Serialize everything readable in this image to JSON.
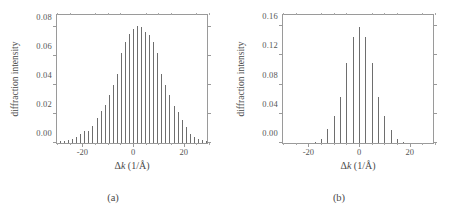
{
  "figure": {
    "panels": [
      {
        "id": "a",
        "caption": "(a)",
        "xlabel_delta": "Δ",
        "xlabel_k": "k",
        "xlabel_unit": " (1/Å)",
        "ylabel": "diffraction intensity"
      },
      {
        "id": "b",
        "caption": "(b)",
        "xlabel_delta": "Δ",
        "xlabel_k": "k",
        "xlabel_unit": " (1/Å)",
        "ylabel": "diffraction intensity"
      }
    ]
  },
  "chart_data": [
    {
      "type": "bar",
      "panel": "a",
      "title": "",
      "xlabel": "Δk (1/Å)",
      "ylabel": "diffraction intensity",
      "xlim": [
        -30,
        30
      ],
      "ylim": [
        0.0,
        0.09
      ],
      "xticks": [
        -20,
        0,
        20
      ],
      "xtick_labels": [
        "-20",
        "0",
        "20"
      ],
      "yticks": [
        0.0,
        0.02,
        0.04,
        0.06,
        0.08
      ],
      "ytick_labels": [
        "0.00",
        "0.02",
        "0.04",
        "0.06",
        "0.08"
      ],
      "grid": false,
      "legend": false,
      "peak_spacing": 1.6,
      "x": [
        -28.8,
        -27.2,
        -25.6,
        -24.0,
        -22.4,
        -20.8,
        -19.2,
        -17.6,
        -16.0,
        -14.4,
        -12.8,
        -11.2,
        -9.6,
        -8.0,
        -6.4,
        -4.8,
        -3.2,
        -1.6,
        0.0,
        1.6,
        3.2,
        4.8,
        6.4,
        8.0,
        9.6,
        11.2,
        12.8,
        14.4,
        16.0,
        17.6,
        19.2,
        20.8,
        22.4,
        24.0,
        25.6,
        27.2,
        28.8
      ],
      "values": [
        0.0012,
        0.0016,
        0.0022,
        0.003,
        0.0042,
        0.006,
        0.0085,
        0.0085,
        0.012,
        0.017,
        0.0225,
        0.026,
        0.0335,
        0.04,
        0.048,
        0.062,
        0.07,
        0.0755,
        0.079,
        0.081,
        0.08,
        0.077,
        0.0745,
        0.07,
        0.062,
        0.048,
        0.04,
        0.033,
        0.0255,
        0.0215,
        0.016,
        0.011,
        0.0065,
        0.004,
        0.0028,
        0.0018,
        0.0012
      ]
    },
    {
      "type": "bar",
      "panel": "b",
      "title": "",
      "xlabel": "Δk (1/Å)",
      "ylabel": "diffraction intensity",
      "xlim": [
        -30,
        30
      ],
      "ylim": [
        0.0,
        0.178
      ],
      "xticks": [
        -20,
        0,
        20
      ],
      "xtick_labels": [
        "-20",
        "0",
        "20"
      ],
      "yticks": [
        0.0,
        0.04,
        0.08,
        0.12,
        0.16
      ],
      "ytick_labels": [
        "0.00",
        "0.04",
        "0.08",
        "0.12",
        "0.16"
      ],
      "grid": false,
      "legend": false,
      "peak_spacing": 2.5,
      "x": [
        -17.5,
        -15.0,
        -12.5,
        -10.0,
        -7.5,
        -5.0,
        -2.5,
        0.0,
        2.5,
        5.0,
        7.5,
        10.0,
        12.5,
        15.0,
        17.5
      ],
      "values": [
        0.002,
        0.005,
        0.019,
        0.0375,
        0.063,
        0.109,
        0.145,
        0.159,
        0.145,
        0.109,
        0.063,
        0.037,
        0.0185,
        0.005,
        0.002
      ]
    }
  ]
}
